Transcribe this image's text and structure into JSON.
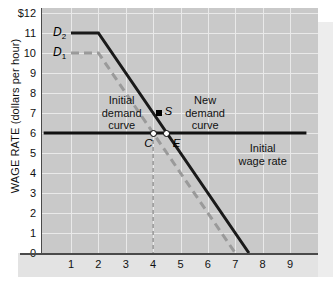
{
  "chart_data": {
    "type": "line",
    "title": "",
    "xlabel": "",
    "ylabel": "WAGE RATE (dollars per hour)",
    "xlim": [
      0,
      9.6
    ],
    "ylim": [
      0,
      12
    ],
    "grid": true,
    "legend": "none",
    "x_ticks": [
      "1",
      "2",
      "3",
      "4",
      "5",
      "6",
      "7",
      "8",
      "9"
    ],
    "x_tick_values": [
      1,
      2,
      3,
      4,
      5,
      6,
      7,
      8,
      9
    ],
    "y_ticks": [
      "$12",
      "11",
      "10",
      "9",
      "8",
      "7",
      "6",
      "5",
      "4",
      "3",
      "2",
      "1",
      "0"
    ],
    "y_tick_values": [
      12,
      11,
      10,
      9,
      8,
      7,
      6,
      5,
      4,
      3,
      2,
      1,
      0
    ],
    "y_origin_label": "0",
    "series": [
      {
        "name": "D2",
        "label": "D",
        "label_sub": "2",
        "style": "solid",
        "color": "#1a1a1a",
        "points": [
          [
            1,
            11
          ],
          [
            2,
            11
          ],
          [
            7.5,
            0
          ]
        ]
      },
      {
        "name": "D1",
        "label": "D",
        "label_sub": "1",
        "style": "dashed",
        "color": "#9a9a9a",
        "points": [
          [
            1,
            10
          ],
          [
            2,
            10
          ],
          [
            7.0,
            0
          ]
        ]
      },
      {
        "name": "initial-wage-rate",
        "label": "Initial wage rate",
        "style": "solid",
        "color": "#111111",
        "points": [
          [
            0,
            6
          ],
          [
            9.6,
            6
          ]
        ]
      },
      {
        "name": "quantity-drop-line",
        "style": "dashed",
        "color": "#9a9a9a",
        "points": [
          [
            4,
            6
          ],
          [
            4,
            0
          ]
        ]
      }
    ],
    "markers": [
      {
        "name": "S",
        "label": "S",
        "x": 4.2,
        "y": 7.0,
        "shape": "filled-square",
        "color": "#000000"
      },
      {
        "name": "C",
        "label": "C",
        "x": 4.0,
        "y": 6.0,
        "shape": "open-circle",
        "color": "#000000"
      },
      {
        "name": "E",
        "label": "E",
        "x": 4.5,
        "y": 6.0,
        "shape": "open-circle",
        "color": "#000000"
      }
    ],
    "annotations": [
      {
        "name": "initial-demand-curve",
        "text": "Initial\ndemand\ncurve",
        "x": 2.85,
        "y": 7.6
      },
      {
        "name": "new-demand-curve",
        "text": "New\ndemand\ncurve",
        "x": 5.9,
        "y": 7.6
      },
      {
        "name": "initial-wage-rate",
        "text": "Initial\nwage rate",
        "x": 8.0,
        "y": 5.2
      }
    ]
  },
  "colors": {
    "plot_background": "#c9c9c9",
    "gridline": "#e9e9e9",
    "axis": "#4a4a4a",
    "demand_new": "#1a1a1a",
    "demand_initial": "#9a9a9a",
    "wage_line": "#111111",
    "page_background": "#ffffff"
  }
}
